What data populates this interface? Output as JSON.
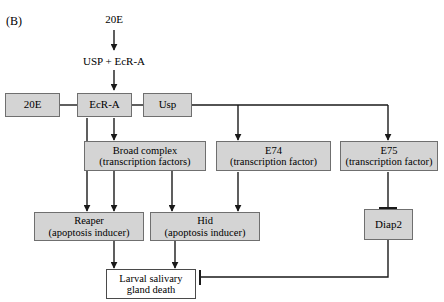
{
  "figure": {
    "panel_label": "(B)",
    "type": "pathway-diagram",
    "fill_color": "#d4d4d4",
    "plain_fill_color": "#ffffff",
    "border_color": "#6f6f6f",
    "line_color": "#1a1a1a"
  },
  "free_text": {
    "hormone": "20E",
    "dimer": "USP + EcR-A"
  },
  "nodes": {
    "ligand_20e": {
      "line1": "20E",
      "line2": ""
    },
    "ecr_a": {
      "line1": "EcR-A",
      "line2": ""
    },
    "usp": {
      "line1": "Usp",
      "line2": ""
    },
    "broad_complex": {
      "line1": "Broad complex",
      "line2": "(transcription factors)"
    },
    "e74": {
      "line1": "E74",
      "line2": "(transcription factor)"
    },
    "e75": {
      "line1": "E75",
      "line2": "(transcription factor)"
    },
    "reaper": {
      "line1": "Reaper",
      "line2": "(apoptosis inducer)"
    },
    "hid": {
      "line1": "Hid",
      "line2": "(apoptosis inducer)"
    },
    "diap2": {
      "line1": "Diap2",
      "line2": ""
    },
    "gland_death": {
      "line1": "Larval salivary",
      "line2": "gland death"
    }
  },
  "edges": [
    {
      "name": "20e-to-dimer",
      "from": "hormone-label",
      "to": "dimer-label",
      "kind": "arrow"
    },
    {
      "name": "dimer-to-ecr-a",
      "from": "dimer-label",
      "to": "ecr_a",
      "kind": "arrow"
    },
    {
      "name": "20e-box-to-ecr-a",
      "from": "ligand_20e",
      "to": "ecr_a",
      "kind": "line"
    },
    {
      "name": "ecr-a-to-usp",
      "from": "ecr_a",
      "to": "usp",
      "kind": "line"
    },
    {
      "name": "ecr-a-to-broad-complex",
      "from": "ecr_a",
      "to": "broad_complex",
      "kind": "arrow"
    },
    {
      "name": "ecr-a-to-reaper",
      "from": "ecr_a",
      "to": "reaper",
      "kind": "arrow"
    },
    {
      "name": "usp-to-e74",
      "from": "usp",
      "to": "e74",
      "kind": "arrow"
    },
    {
      "name": "usp-to-e75",
      "from": "usp",
      "to": "e75",
      "kind": "arrow"
    },
    {
      "name": "broad-complex-to-reaper",
      "from": "broad_complex",
      "to": "reaper",
      "kind": "arrow"
    },
    {
      "name": "broad-complex-to-hid",
      "from": "broad_complex",
      "to": "hid",
      "kind": "arrow"
    },
    {
      "name": "e74-to-hid",
      "from": "e74",
      "to": "hid",
      "kind": "arrow"
    },
    {
      "name": "e75-inhibits-diap2",
      "from": "e75",
      "to": "diap2",
      "kind": "inhibition"
    },
    {
      "name": "reaper-to-gland-death",
      "from": "reaper",
      "to": "gland_death",
      "kind": "arrow"
    },
    {
      "name": "hid-to-gland-death",
      "from": "hid",
      "to": "gland_death",
      "kind": "arrow"
    },
    {
      "name": "diap2-inhibits-gland-death",
      "from": "diap2",
      "to": "gland_death",
      "kind": "inhibition"
    }
  ]
}
